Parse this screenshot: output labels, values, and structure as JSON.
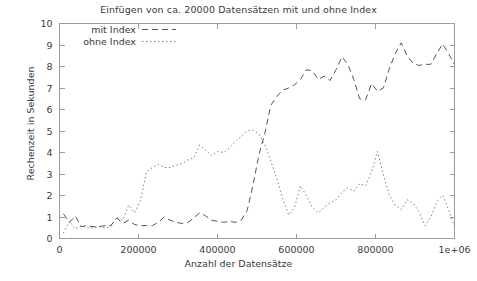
{
  "chart_data": {
    "type": "line",
    "title": "Einfügen von ca. 20000 Datensätzen mit und ohne Index",
    "xlabel": "Anzahl der Datensätze",
    "ylabel": "Rechenzeit in Sekunden",
    "xlim": [
      0,
      1000000
    ],
    "ylim": [
      0,
      10
    ],
    "grid": false,
    "legend_position": "top-left-inside",
    "xticks": [
      0,
      200000,
      400000,
      600000,
      800000,
      1000000
    ],
    "xtick_labels": [
      "0",
      "200000",
      "400000",
      "600000",
      "800000",
      "1e+06"
    ],
    "yticks": [
      0,
      1,
      2,
      3,
      4,
      5,
      6,
      7,
      8,
      9,
      10
    ],
    "ytick_labels": [
      "0",
      "1",
      "2",
      "3",
      "4",
      "5",
      "6",
      "7",
      "8",
      "9",
      "10"
    ],
    "series": [
      {
        "name": "mit Index",
        "dash": "dashed",
        "color": "#555555",
        "x": [
          10000,
          25000,
          40000,
          55000,
          70000,
          85000,
          100000,
          115000,
          130000,
          145000,
          160000,
          175000,
          190000,
          205000,
          220000,
          235000,
          250000,
          265000,
          280000,
          295000,
          310000,
          325000,
          340000,
          355000,
          370000,
          385000,
          400000,
          415000,
          430000,
          445000,
          460000,
          475000,
          490000,
          505000,
          520000,
          535000,
          550000,
          565000,
          580000,
          595000,
          610000,
          625000,
          640000,
          655000,
          670000,
          685000,
          700000,
          715000,
          730000,
          745000,
          760000,
          775000,
          790000,
          805000,
          820000,
          835000,
          850000,
          865000,
          880000,
          895000,
          910000,
          925000,
          940000,
          955000,
          970000,
          985000,
          1000000
        ],
        "y": [
          1.15,
          0.75,
          1.05,
          0.55,
          0.6,
          0.55,
          0.55,
          0.6,
          0.6,
          0.95,
          0.7,
          0.85,
          0.65,
          0.6,
          0.6,
          0.6,
          0.75,
          1.0,
          0.85,
          0.75,
          0.7,
          0.75,
          0.95,
          1.2,
          1.05,
          0.85,
          0.8,
          0.75,
          0.8,
          0.75,
          0.85,
          1.3,
          2.5,
          3.9,
          4.9,
          6.2,
          6.6,
          6.9,
          7.0,
          7.15,
          7.4,
          7.85,
          7.8,
          7.4,
          7.55,
          7.35,
          7.85,
          8.45,
          8.1,
          7.4,
          6.5,
          6.45,
          7.2,
          6.85,
          7.0,
          7.9,
          8.6,
          9.1,
          8.5,
          8.15,
          8.05,
          8.1,
          8.1,
          8.6,
          9.05,
          8.6,
          8.1
        ]
      },
      {
        "name": "ohne Index",
        "dash": "dotted",
        "color": "#777777",
        "x": [
          10000,
          25000,
          40000,
          55000,
          70000,
          85000,
          100000,
          115000,
          130000,
          145000,
          160000,
          175000,
          190000,
          205000,
          220000,
          235000,
          250000,
          265000,
          280000,
          295000,
          310000,
          325000,
          340000,
          355000,
          370000,
          385000,
          400000,
          415000,
          430000,
          445000,
          460000,
          475000,
          490000,
          505000,
          520000,
          535000,
          550000,
          565000,
          580000,
          595000,
          610000,
          625000,
          640000,
          655000,
          670000,
          685000,
          700000,
          715000,
          730000,
          745000,
          760000,
          775000,
          790000,
          805000,
          820000,
          835000,
          850000,
          865000,
          880000,
          895000,
          910000,
          925000,
          940000,
          955000,
          970000,
          985000,
          1000000
        ],
        "y": [
          0.25,
          0.8,
          0.45,
          0.6,
          0.5,
          0.5,
          0.55,
          0.5,
          0.55,
          1.0,
          0.85,
          1.55,
          1.2,
          1.75,
          3.1,
          3.3,
          3.45,
          3.3,
          3.3,
          3.4,
          3.5,
          3.65,
          3.75,
          4.35,
          4.1,
          3.85,
          4.05,
          4.0,
          4.2,
          4.5,
          4.75,
          5.0,
          5.05,
          4.85,
          4.35,
          3.6,
          2.8,
          1.85,
          1.1,
          1.45,
          2.45,
          2.0,
          1.45,
          1.2,
          1.45,
          1.65,
          1.8,
          2.15,
          2.35,
          2.2,
          2.55,
          2.45,
          3.1,
          4.05,
          2.95,
          2.0,
          1.55,
          1.35,
          1.8,
          1.65,
          1.25,
          0.6,
          1.0,
          1.7,
          2.0,
          1.35,
          0.55
        ]
      }
    ]
  },
  "legend": {
    "entries": [
      {
        "label": "mit Index",
        "style": "dashed"
      },
      {
        "label": "ohne Index",
        "style": "dotted"
      }
    ]
  }
}
